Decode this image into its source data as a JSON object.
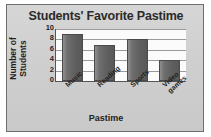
{
  "chart_data": {
    "type": "bar",
    "title": "Students' Favorite Pastime",
    "xlabel": "Pastime",
    "ylabel": "Number of Students",
    "categories": [
      "Music",
      "Reading",
      "Sports",
      "Video games"
    ],
    "values": [
      9,
      7,
      8,
      4
    ],
    "ylim": [
      0,
      10
    ],
    "yticks": [
      0,
      2,
      4,
      6,
      8,
      10
    ],
    "ytick_labels": [
      "0",
      "2",
      "4",
      "6",
      "8",
      "10"
    ],
    "grid": true,
    "legend": false,
    "bar_color": "#606060",
    "plot_background": "#fbfbfb",
    "panel_background": "#d2d2d2",
    "text_color": "#1f1f1f",
    "title_color": "#2b2b2b"
  }
}
